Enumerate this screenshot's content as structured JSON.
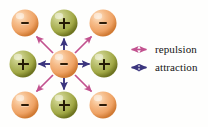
{
  "figure": {
    "background_color": "#fefefd"
  },
  "colors": {
    "negative_sphere": "#f0a768",
    "negative_sphere_light": "#fbd7b2",
    "negative_sphere_dark": "#d07a33",
    "positive_sphere": "#a8ae4e",
    "positive_sphere_light": "#d7da92",
    "positive_sphere_dark": "#6e7420",
    "repulsion": "#c2528f",
    "attraction": "#3b357e",
    "sign_color": "#2d1b07"
  },
  "lattice": {
    "rows": [
      [
        {
          "charge": "-",
          "label": "-",
          "polarity": "negative",
          "cx": 25,
          "cy": 23
        },
        {
          "charge": "+",
          "label": "+",
          "polarity": "positive",
          "cx": 64,
          "cy": 23
        },
        {
          "charge": "-",
          "label": "-",
          "polarity": "negative",
          "cx": 103,
          "cy": 23
        }
      ],
      [
        {
          "charge": "+",
          "label": "+",
          "polarity": "positive",
          "cx": 23,
          "cy": 64
        },
        {
          "charge": "-",
          "label": "-",
          "polarity": "negative",
          "cx": 64,
          "cy": 64
        },
        {
          "charge": "+",
          "label": "+",
          "polarity": "positive",
          "cx": 104,
          "cy": 64
        }
      ],
      [
        {
          "charge": "-",
          "label": "-",
          "polarity": "negative",
          "cx": 25,
          "cy": 105
        },
        {
          "charge": "+",
          "label": "+",
          "polarity": "positive",
          "cx": 64,
          "cy": 105
        },
        {
          "charge": "-",
          "label": "-",
          "polarity": "negative",
          "cx": 103,
          "cy": 105
        }
      ]
    ],
    "sphere_radius": 14,
    "center": {
      "cx": 64,
      "cy": 64
    }
  },
  "force_arrows": [
    {
      "type": "repulsion",
      "direction": "up-left",
      "from": [
        53,
        53
      ],
      "to": [
        36,
        36
      ]
    },
    {
      "type": "attraction",
      "direction": "up",
      "from": [
        64,
        49
      ],
      "to": [
        64,
        38
      ]
    },
    {
      "type": "repulsion",
      "direction": "up-right",
      "from": [
        75,
        53
      ],
      "to": [
        92,
        36
      ]
    },
    {
      "type": "attraction",
      "direction": "left",
      "from": [
        49,
        64
      ],
      "to": [
        38,
        64
      ]
    },
    {
      "type": "attraction",
      "direction": "right",
      "from": [
        79,
        64
      ],
      "to": [
        90,
        64
      ]
    },
    {
      "type": "repulsion",
      "direction": "down-left",
      "from": [
        53,
        75
      ],
      "to": [
        36,
        92
      ]
    },
    {
      "type": "attraction",
      "direction": "down",
      "from": [
        64,
        79
      ],
      "to": [
        64,
        90
      ]
    },
    {
      "type": "repulsion",
      "direction": "down-right",
      "from": [
        75,
        75
      ],
      "to": [
        92,
        92
      ]
    }
  ],
  "legend": {
    "x": 128,
    "y": 41,
    "items": [
      {
        "id": "repulsion",
        "label": "repulsion",
        "color": "#c2528f",
        "arrow": "double-headed-arrow",
        "y": 43
      },
      {
        "id": "attraction",
        "label": "attraction",
        "color": "#3b357e",
        "arrow": "double-headed-arrow",
        "y": 61
      }
    ]
  }
}
